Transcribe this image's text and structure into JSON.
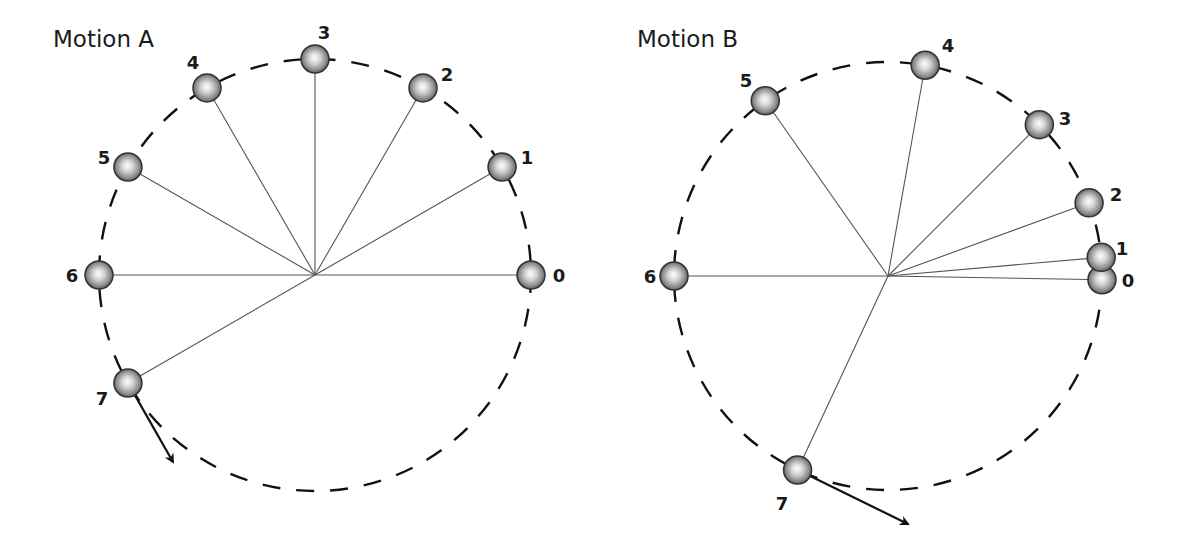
{
  "chart_data": {
    "type": "diagram",
    "panels": [
      {
        "id": "A",
        "title": "Motion A",
        "center": [
          315,
          275
        ],
        "radius": 216,
        "title_pos": [
          53,
          47
        ],
        "positions": [
          {
            "label": "0",
            "angle_deg": 0,
            "label_pos": [
              559,
              282
            ]
          },
          {
            "label": "1",
            "angle_deg": 30,
            "label_pos": [
              527,
              164
            ]
          },
          {
            "label": "2",
            "angle_deg": 60,
            "label_pos": [
              447,
              81
            ]
          },
          {
            "label": "3",
            "angle_deg": 90,
            "label_pos": [
              324,
              39
            ]
          },
          {
            "label": "4",
            "angle_deg": 120,
            "label_pos": [
              193,
              69
            ]
          },
          {
            "label": "5",
            "angle_deg": 150,
            "label_pos": [
              104,
              164
            ]
          },
          {
            "label": "6",
            "angle_deg": 180,
            "label_pos": [
              72,
              282
            ]
          },
          {
            "label": "7",
            "angle_deg": 210,
            "label_pos": [
              102,
              405
            ]
          }
        ],
        "velocity_arrow": {
          "from_label": "7",
          "tip": [
            173,
            462
          ]
        },
        "note": "Equal 30° angular steps (uniform circular motion)"
      },
      {
        "id": "B",
        "title": "Motion B",
        "center": [
          888,
          276
        ],
        "radius": 214,
        "title_pos": [
          637,
          47
        ],
        "positions": [
          {
            "label": "0",
            "angle_deg": -1,
            "label_pos": [
              1128,
              287
            ]
          },
          {
            "label": "1",
            "angle_deg": 5,
            "label_pos": [
              1122,
              255
            ]
          },
          {
            "label": "2",
            "angle_deg": 20,
            "label_pos": [
              1116,
              201
            ]
          },
          {
            "label": "3",
            "angle_deg": 45,
            "label_pos": [
              1065,
              125
            ]
          },
          {
            "label": "4",
            "angle_deg": 80,
            "label_pos": [
              948,
              52
            ]
          },
          {
            "label": "5",
            "angle_deg": 125,
            "label_pos": [
              746,
              87
            ]
          },
          {
            "label": "6",
            "angle_deg": 180,
            "label_pos": [
              650,
              283
            ]
          },
          {
            "label": "7",
            "angle_deg": 245,
            "label_pos": [
              782,
              510
            ]
          }
        ],
        "velocity_arrow": {
          "from_label": "7",
          "tip": [
            908,
            524
          ]
        },
        "note": "Increasing angular steps (speeding up, non-uniform circular motion)"
      }
    ]
  },
  "style": {
    "ball_radius": 14,
    "ball_highlight": "#ffffff",
    "ball_mid": "#b8b8b8",
    "ball_edge": "#4a4a4a",
    "dash_color": "#111111",
    "spoke_color": "#555555"
  }
}
